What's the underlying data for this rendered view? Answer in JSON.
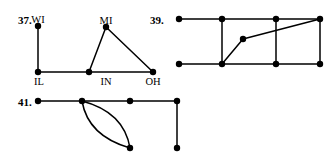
{
  "page": {
    "width": 329,
    "height": 162,
    "background_color": "#ffffff",
    "ink_color": "#000000"
  },
  "problems": {
    "p37": {
      "number_label": "37.",
      "number_pos": {
        "x": 18,
        "y": 14
      },
      "vertex_labels": [
        {
          "name": "WI",
          "text": "WI",
          "x": 38,
          "y": 14,
          "anchor": "middle"
        },
        {
          "name": "MI",
          "text": "MI",
          "x": 106,
          "y": 15,
          "anchor": "middle"
        },
        {
          "name": "IL",
          "text": "IL",
          "x": 38,
          "y": 79,
          "anchor": "middle"
        },
        {
          "name": "IN",
          "text": "IN",
          "x": 106,
          "y": 79,
          "anchor": "middle"
        },
        {
          "name": "OH",
          "text": "OH",
          "x": 153,
          "y": 79,
          "anchor": "middle"
        }
      ],
      "vertices": [
        {
          "id": "WI",
          "x": 38,
          "y": 26,
          "r": 3.2
        },
        {
          "id": "MI",
          "x": 106,
          "y": 27,
          "r": 3.2
        },
        {
          "id": "IL",
          "x": 38,
          "y": 72,
          "r": 3.2
        },
        {
          "id": "IN",
          "x": 106,
          "y": 72,
          "r": 3.2
        },
        {
          "id": "OH",
          "x": 153,
          "y": 72,
          "r": 3.2
        }
      ],
      "edges": [
        {
          "from": "WI",
          "to": "IL",
          "x1": 38,
          "y1": 26,
          "x2": 38,
          "y2": 72
        },
        {
          "from": "IL",
          "to": "IN",
          "x1": 38,
          "y1": 72,
          "x2": 106,
          "y2": 72
        },
        {
          "from": "IN",
          "to": "OH",
          "x1": 106,
          "y1": 72,
          "x2": 153,
          "y2": 72
        },
        {
          "from": "MI",
          "to": "IN",
          "x1": 106,
          "y1": 27,
          "x2": 106,
          "y2": 72
        },
        {
          "from": "MI",
          "to": "OH",
          "x1": 106,
          "y1": 27,
          "x2": 153,
          "y2": 72
        }
      ],
      "edge_note": "MI-IN edge is drawn as the left side of the triangle slanting from MI down-left to IN",
      "triangle_left_edge": {
        "x1": 106,
        "y1": 27,
        "x2": 88,
        "y2": 72
      }
    },
    "p39": {
      "number_label": "39.",
      "number_pos": {
        "x": 150,
        "y": 14
      },
      "vertices": [
        {
          "id": "a",
          "x": 179,
          "y": 19,
          "r": 3.2
        },
        {
          "id": "b",
          "x": 222,
          "y": 19,
          "r": 3.2
        },
        {
          "id": "c",
          "x": 276,
          "y": 19,
          "r": 3.2
        },
        {
          "id": "d",
          "x": 320,
          "y": 19,
          "r": 3.2
        },
        {
          "id": "e",
          "x": 179,
          "y": 64,
          "r": 3.2
        },
        {
          "id": "f",
          "x": 222,
          "y": 64,
          "r": 3.2
        },
        {
          "id": "g",
          "x": 276,
          "y": 64,
          "r": 3.2
        },
        {
          "id": "h",
          "x": 320,
          "y": 64,
          "r": 3.2
        },
        {
          "id": "m",
          "x": 243,
          "y": 39,
          "r": 3.2
        }
      ],
      "edges": [
        {
          "from": "a",
          "to": "b",
          "x1": 179,
          "y1": 19,
          "x2": 222,
          "y2": 19
        },
        {
          "from": "b",
          "to": "c",
          "x1": 222,
          "y1": 19,
          "x2": 276,
          "y2": 19
        },
        {
          "from": "c",
          "to": "d",
          "x1": 276,
          "y1": 19,
          "x2": 320,
          "y2": 19
        },
        {
          "from": "e",
          "to": "f",
          "x1": 179,
          "y1": 64,
          "x2": 222,
          "y2": 64
        },
        {
          "from": "f",
          "to": "g",
          "x1": 222,
          "y1": 64,
          "x2": 276,
          "y2": 64
        },
        {
          "from": "g",
          "to": "h",
          "x1": 276,
          "y1": 64,
          "x2": 320,
          "y2": 64
        },
        {
          "from": "b",
          "to": "f",
          "x1": 222,
          "y1": 19,
          "x2": 222,
          "y2": 64
        },
        {
          "from": "c",
          "to": "g",
          "x1": 276,
          "y1": 19,
          "x2": 276,
          "y2": 64
        },
        {
          "from": "d",
          "to": "h",
          "x1": 320,
          "y1": 19,
          "x2": 320,
          "y2": 64
        },
        {
          "from": "f",
          "to": "m",
          "x1": 222,
          "y1": 64,
          "x2": 243,
          "y2": 39
        },
        {
          "from": "m",
          "to": "d",
          "x1": 243,
          "y1": 39,
          "x2": 320,
          "y2": 19
        }
      ]
    },
    "p41": {
      "number_label": "41.",
      "number_pos": {
        "x": 18,
        "y": 96
      },
      "vertices": [
        {
          "id": "a",
          "x": 38,
          "y": 101,
          "r": 3.2
        },
        {
          "id": "b",
          "x": 82,
          "y": 101,
          "r": 3.2
        },
        {
          "id": "c",
          "x": 130,
          "y": 101,
          "r": 3.2
        },
        {
          "id": "d",
          "x": 177,
          "y": 101,
          "r": 3.2
        },
        {
          "id": "e",
          "x": 130,
          "y": 148,
          "r": 3.2
        },
        {
          "id": "f",
          "x": 177,
          "y": 148,
          "r": 3.2
        }
      ],
      "edges": [
        {
          "from": "a",
          "to": "b",
          "x1": 38,
          "y1": 101,
          "x2": 82,
          "y2": 101
        },
        {
          "from": "b",
          "to": "c",
          "x1": 82,
          "y1": 101,
          "x2": 130,
          "y2": 101
        },
        {
          "from": "c",
          "to": "d",
          "x1": 130,
          "y1": 101,
          "x2": 177,
          "y2": 101
        },
        {
          "from": "d",
          "to": "f",
          "x1": 177,
          "y1": 101,
          "x2": 177,
          "y2": 148
        }
      ],
      "curved_edges": [
        {
          "from": "b",
          "to": "e",
          "path": "M 82 101 Q 95 145 130 148",
          "note": "lower arc of double edge"
        },
        {
          "from": "b",
          "to": "e",
          "path": "M 82 101 Q 122 110 130 148",
          "note": "upper arc of double edge"
        }
      ]
    }
  }
}
